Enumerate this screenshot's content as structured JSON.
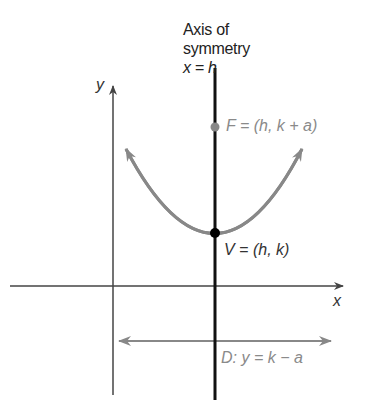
{
  "diagram": {
    "title_line1": "Axis of",
    "title_line2": "symmetry",
    "axis_equation": "x = h",
    "y_axis_label": "y",
    "x_axis_label": "x",
    "focus_label": "F = (h, k + a)",
    "vertex_label": "V = (h, k)",
    "directrix_label": "D: y = k − a",
    "colors": {
      "axes": "#444444",
      "axis_of_symmetry": "#111111",
      "parabola": "#888888",
      "focus_point": "#888888",
      "vertex_point": "#000000",
      "directrix": "#888888",
      "grey_text": "#8a8a8a"
    }
  }
}
